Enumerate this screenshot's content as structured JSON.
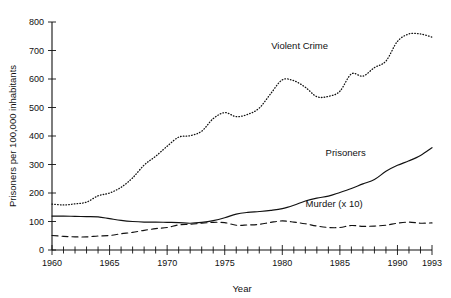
{
  "chart_data": {
    "type": "line",
    "title": "",
    "xlabel": "Year",
    "ylabel": "Prisoners per 100,000 inhabitants",
    "xlim": [
      1960,
      1993
    ],
    "ylim": [
      0,
      800
    ],
    "grid": false,
    "legend_position": "inline-annotations",
    "x_tick_labels": [
      "1960",
      "1965",
      "1970",
      "1975",
      "1980",
      "1985",
      "1990",
      "1993"
    ],
    "x_tick_values": [
      1960,
      1965,
      1970,
      1975,
      1980,
      1985,
      1990,
      1993
    ],
    "x_minor_tick_step": 1,
    "y_tick_labels": [
      "0",
      "100",
      "200",
      "300",
      "400",
      "500",
      "600",
      "700",
      "800"
    ],
    "y_tick_values": [
      0,
      100,
      200,
      300,
      400,
      500,
      600,
      700,
      800
    ],
    "x": [
      1960,
      1961,
      1962,
      1963,
      1964,
      1965,
      1966,
      1967,
      1968,
      1969,
      1970,
      1971,
      1972,
      1973,
      1974,
      1975,
      1976,
      1977,
      1978,
      1979,
      1980,
      1981,
      1982,
      1983,
      1984,
      1985,
      1986,
      1987,
      1988,
      1989,
      1990,
      1991,
      1992,
      1993
    ],
    "series": [
      {
        "name": "Violent Crime",
        "style": "dotted",
        "label_x": 1981.5,
        "label_y": 705,
        "values": [
          161,
          158,
          162,
          168,
          190,
          200,
          220,
          253,
          298,
          329,
          364,
          396,
          401,
          417,
          461,
          482,
          468,
          476,
          498,
          549,
          597,
          594,
          571,
          538,
          539,
          557,
          618,
          610,
          640,
          663,
          732,
          758,
          758,
          747
        ]
      },
      {
        "name": "Prisoners",
        "style": "solid",
        "label_x": 1985.5,
        "label_y": 330,
        "values": [
          119,
          119,
          118,
          117,
          116,
          110,
          104,
          100,
          98,
          98,
          97,
          96,
          94,
          97,
          103,
          113,
          126,
          132,
          135,
          139,
          145,
          157,
          172,
          182,
          189,
          202,
          216,
          232,
          247,
          276,
          297,
          313,
          332,
          359
        ]
      },
      {
        "name": "Murder (x 10)",
        "style": "dashed",
        "label_x": 1984.5,
        "label_y": 150,
        "values": [
          51,
          48,
          46,
          46,
          49,
          51,
          57,
          62,
          69,
          75,
          79,
          88,
          90,
          94,
          97,
          96,
          87,
          88,
          90,
          97,
          102,
          98,
          92,
          84,
          79,
          79,
          86,
          83,
          84,
          87,
          94,
          98,
          94,
          95
        ]
      }
    ]
  }
}
